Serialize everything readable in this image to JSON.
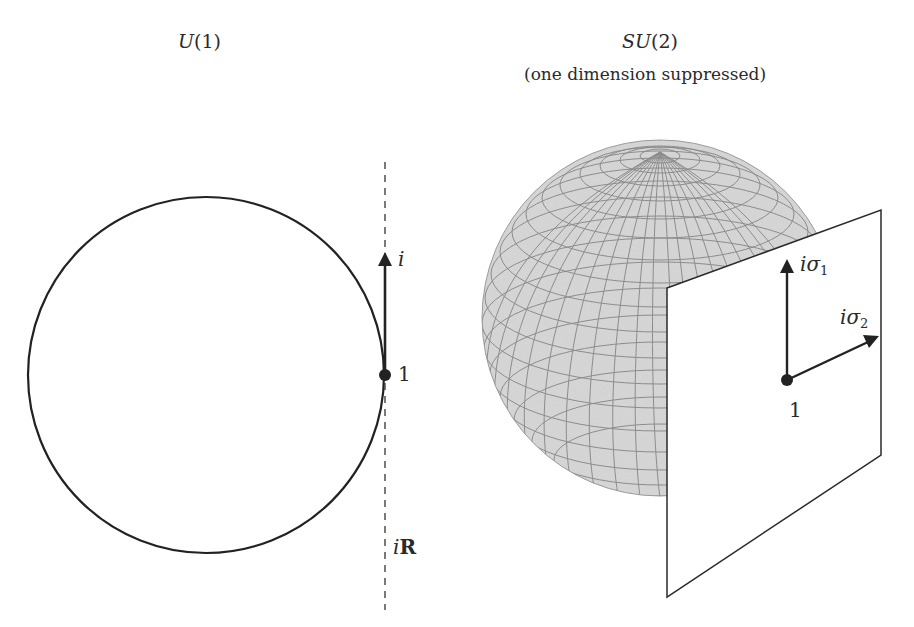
{
  "left_panel": {
    "title": "U(1)",
    "title_parts": {
      "italic": "U",
      "rest": "(1)"
    },
    "circle": {
      "cx": 206,
      "cy": 375,
      "r": 178
    },
    "tangent_line": {
      "x": 385,
      "y1": 162,
      "y2": 610,
      "style": "dashed"
    },
    "point": {
      "label": "1",
      "x": 385,
      "y": 375
    },
    "tangent_vector": {
      "label": "i",
      "from": [
        385,
        375
      ],
      "to": [
        385,
        255
      ]
    },
    "tangent_space_label": {
      "italic": "i",
      "bold": "R"
    }
  },
  "right_panel": {
    "title": "SU(2)",
    "title_parts": {
      "italic": "SU",
      "rest": "(2)"
    },
    "subtitle": "(one dimension suppressed)",
    "sphere": {
      "cx": 660,
      "cy": 318,
      "r": 178,
      "fill": "#d9d9d9",
      "grid_color": "#8a8a8a"
    },
    "tangent_plane": {
      "points": [
        [
          667,
          288
        ],
        [
          881,
          210
        ],
        [
          881,
          455
        ],
        [
          667,
          597
        ]
      ]
    },
    "point": {
      "label": "1",
      "x": 787,
      "y": 380
    },
    "vectors": [
      {
        "label_italic": "iσ",
        "sub": "1",
        "from": [
          787,
          380
        ],
        "to": [
          787,
          262
        ]
      },
      {
        "label_italic": "iσ",
        "sub": "2",
        "from": [
          787,
          380
        ],
        "to": [
          878,
          337
        ]
      }
    ]
  },
  "colors": {
    "ink": "#222222",
    "sphere_fill": "#d6d6d6",
    "grid": "#8c8c8c",
    "background": "#ffffff"
  }
}
